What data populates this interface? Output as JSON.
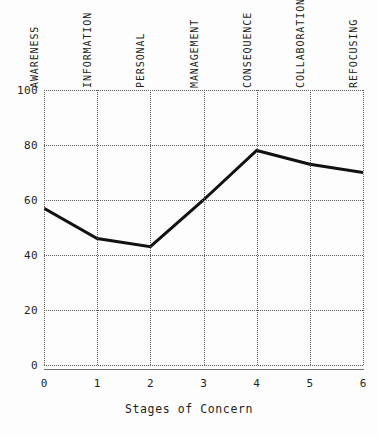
{
  "chart_data": {
    "type": "line",
    "title": "",
    "xlabel": "Stages of Concern",
    "ylabel": "",
    "x": [
      0,
      1,
      2,
      3,
      4,
      5,
      6
    ],
    "values": [
      57,
      46,
      43,
      60,
      78,
      73,
      70
    ],
    "categories": [
      "AWARENESS",
      "INFORMATION",
      "PERSONAL",
      "MANAGEMENT",
      "CONSEQUENCE",
      "COLLABORATION",
      "REFOCUSING"
    ],
    "xlim": [
      0,
      6
    ],
    "ylim": [
      0,
      100
    ],
    "xticklabels": [
      "0",
      "1",
      "2",
      "3",
      "4",
      "5",
      "6"
    ],
    "yticklabels": [
      "0",
      "20",
      "40",
      "60",
      "80",
      "100"
    ],
    "yticks": [
      0,
      20,
      40,
      60,
      80,
      100
    ],
    "grid": true,
    "grid_style": "dotted",
    "legend": "none",
    "series_color": "#111111",
    "grid_color": "#5c5c5c",
    "axis_color": "#6e6e6e",
    "background": "#fdfdfd"
  },
  "axis": {
    "x_title": "Stages of Concern"
  }
}
